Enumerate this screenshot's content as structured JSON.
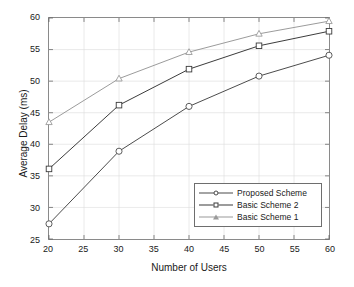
{
  "chart_data": {
    "type": "line",
    "title": "",
    "xlabel": "Number of Users",
    "ylabel": "Average Delay (ms)",
    "xlim": [
      20,
      60
    ],
    "ylim": [
      25,
      60
    ],
    "xticks": [
      20,
      25,
      30,
      35,
      40,
      45,
      50,
      55,
      60
    ],
    "yticks": [
      25,
      30,
      35,
      40,
      45,
      50,
      55,
      60
    ],
    "grid": true,
    "legend_position": "lower right",
    "x": [
      20,
      30,
      40,
      50,
      60
    ],
    "series": [
      {
        "name": "Proposed Scheme",
        "marker": "circle",
        "color": "#4a4a4a",
        "values": [
          27.4,
          38.9,
          46.0,
          50.8,
          54.1
        ]
      },
      {
        "name": "Basic Scheme 2",
        "marker": "square",
        "color": "#3a3a3a",
        "values": [
          36.1,
          46.2,
          51.9,
          55.6,
          57.9
        ]
      },
      {
        "name": "Basic Scheme 1",
        "marker": "triangle",
        "color": "#9a9a9a",
        "values": [
          43.5,
          50.4,
          54.6,
          57.5,
          59.5
        ]
      }
    ]
  },
  "axis": {
    "xtick_labels": [
      "20",
      "25",
      "30",
      "35",
      "40",
      "45",
      "50",
      "55",
      "60"
    ],
    "ytick_labels": [
      "25",
      "30",
      "35",
      "40",
      "45",
      "50",
      "55",
      "60"
    ]
  },
  "legend": {
    "items": [
      {
        "label": "Proposed Scheme"
      },
      {
        "label": "Basic Scheme 2"
      },
      {
        "label": "Basic Scheme 1"
      }
    ]
  }
}
